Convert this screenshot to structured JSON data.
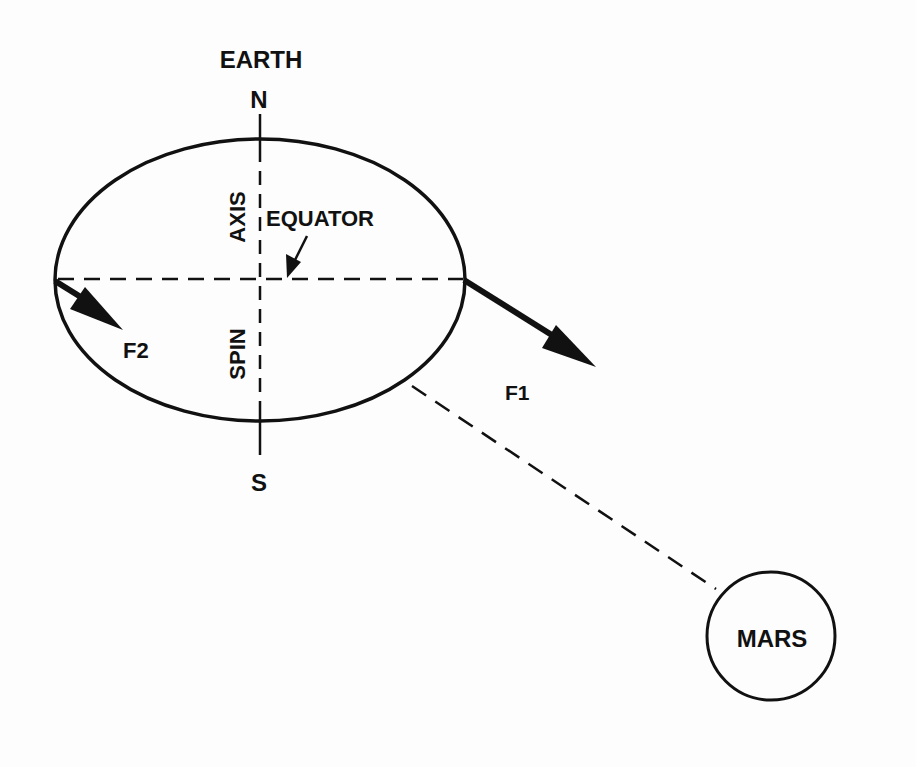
{
  "diagram": {
    "type": "physics-diagram",
    "colors": {
      "ink": "#111111",
      "background": "#fdfdfd"
    },
    "earth": {
      "label": "EARTH",
      "north_label": "N",
      "south_label": "S",
      "axis_label": "AXIS",
      "spin_label": "SPIN",
      "equator_label": "EQUATOR"
    },
    "forces": {
      "f1_label": "F1",
      "f2_label": "F2"
    },
    "mars": {
      "label": "MARS"
    }
  }
}
